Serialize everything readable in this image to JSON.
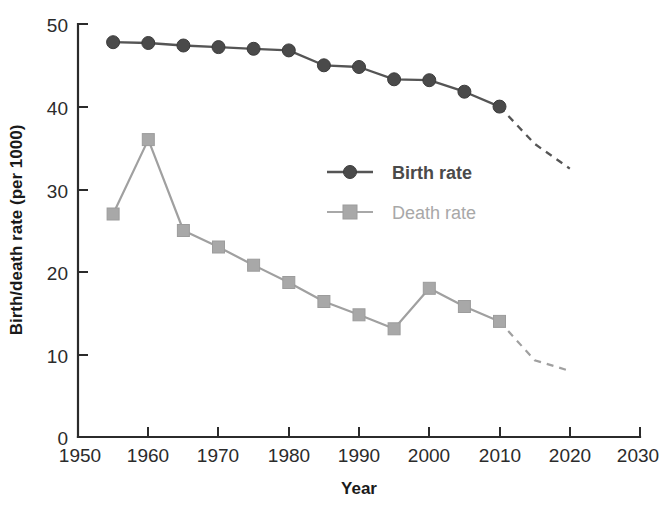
{
  "chart_data": {
    "type": "line",
    "title": "",
    "xlabel": "Year",
    "ylabel": "Birth/death rate (per 1000)",
    "xlim": [
      1950,
      2030
    ],
    "ylim": [
      0,
      50
    ],
    "xticks": [
      1950,
      1960,
      1970,
      1980,
      1990,
      2000,
      2010,
      2020,
      2030
    ],
    "yticks": [
      0,
      10,
      20,
      30,
      40,
      50
    ],
    "grid": false,
    "legend_position": "center-right",
    "series": [
      {
        "name": "Birth rate",
        "marker": "circle",
        "color": "#4a4a4a",
        "x": [
          1955,
          1960,
          1965,
          1970,
          1975,
          1980,
          1985,
          1990,
          1995,
          2000,
          2005,
          2010
        ],
        "values": [
          47.8,
          47.7,
          47.4,
          47.2,
          47.0,
          46.8,
          45.0,
          44.8,
          43.3,
          43.2,
          41.8,
          40.0
        ],
        "projection_x": [
          2010,
          2015,
          2020
        ],
        "projection_values": [
          40.0,
          35.5,
          32.5
        ],
        "projection_style": "dashed"
      },
      {
        "name": "Death rate",
        "marker": "square",
        "color": "#a8a8a8",
        "x": [
          1955,
          1960,
          1965,
          1970,
          1975,
          1980,
          1985,
          1990,
          1995,
          2000,
          2005,
          2010
        ],
        "values": [
          27.0,
          36.0,
          25.0,
          23.0,
          20.8,
          18.7,
          16.4,
          14.8,
          13.1,
          18.0,
          15.8,
          14.0
        ],
        "projection_x": [
          2010,
          2015,
          2020
        ],
        "projection_values": [
          14.0,
          9.3,
          8.0
        ],
        "projection_style": "dashed"
      }
    ]
  },
  "axes": {
    "y_label": "Birth/death rate (per 1000)",
    "x_label": "Year",
    "y_tick_labels": [
      "0",
      "10",
      "20",
      "30",
      "40",
      "50"
    ],
    "x_tick_labels": [
      "1950",
      "1960",
      "1970",
      "1980",
      "1990",
      "2000",
      "2010",
      "2020",
      "2030"
    ]
  },
  "legend": {
    "entries": [
      {
        "label": "Birth rate",
        "marker": "circle-marker",
        "color": "#4a4a4a"
      },
      {
        "label": "Death rate",
        "marker": "square-marker",
        "color": "#a8a8a8"
      }
    ]
  }
}
